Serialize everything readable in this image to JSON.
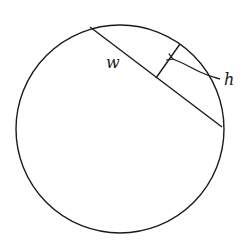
{
  "diagram": {
    "title": "",
    "stroke_color": "#1a1a1a",
    "background": "#ffffff",
    "circle": {
      "cx": 120,
      "cy": 129,
      "r": 104
    },
    "chord": {
      "label": "w",
      "x1": 90,
      "y1": 27,
      "x2": 222,
      "y2": 127
    },
    "height_segment": {
      "label": "h",
      "x1": 156,
      "y1": 78,
      "x2": 180,
      "y2": 44
    },
    "labels": {
      "w": "w",
      "h": "h"
    }
  }
}
